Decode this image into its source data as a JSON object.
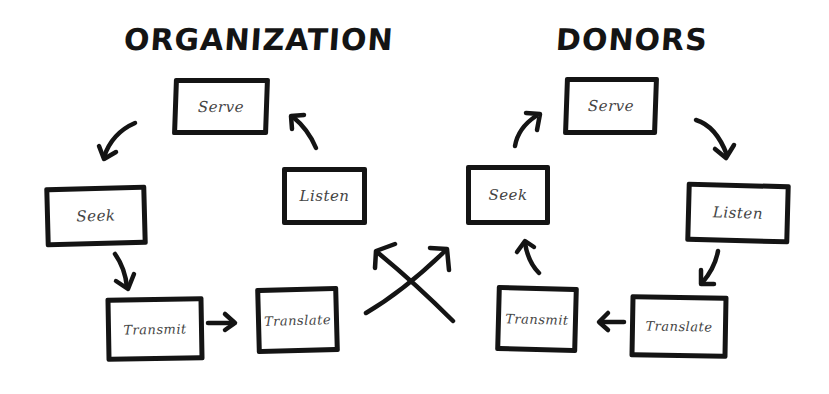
{
  "diagram": {
    "left_cycle": {
      "title": "ORGANIZATION",
      "nodes": [
        {
          "id": "serve",
          "label": "Serve"
        },
        {
          "id": "seek",
          "label": "Seek"
        },
        {
          "id": "transmit",
          "label": "Transmit"
        },
        {
          "id": "translate",
          "label": "Translate"
        },
        {
          "id": "listen",
          "label": "Listen"
        }
      ],
      "flow": [
        "Serve",
        "Seek",
        "Transmit",
        "Translate",
        "Listen",
        "Serve"
      ]
    },
    "right_cycle": {
      "title": "DONORS",
      "nodes": [
        {
          "id": "serve",
          "label": "Serve"
        },
        {
          "id": "listen",
          "label": "Listen"
        },
        {
          "id": "translate",
          "label": "Translate"
        },
        {
          "id": "transmit",
          "label": "Transmit"
        },
        {
          "id": "seek",
          "label": "Seek"
        }
      ],
      "flow": [
        "Serve",
        "Listen",
        "Translate",
        "Transmit",
        "Seek",
        "Serve"
      ]
    },
    "connector": {
      "type": "crossed-arrows",
      "description": "Organization Translate leads to Donors Seek; Donors Transmit leads to Organization Listen"
    },
    "colors": {
      "stroke": "#141414",
      "text": "#444444",
      "background": "#ffffff"
    }
  }
}
